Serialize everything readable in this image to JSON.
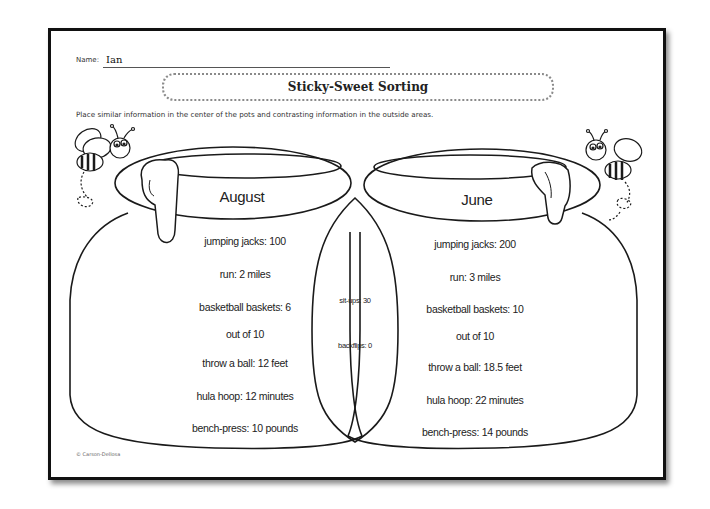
{
  "worksheet": {
    "name_label": "Name:",
    "name_value": "Ian",
    "title": "Sticky-Sweet Sorting",
    "instructions": "Place similar information in the center of the pots and contrasting information in the outside areas.",
    "copyright": "© Carson-Dellosa"
  },
  "left_pot": {
    "heading": "August",
    "items": [
      "jumping jacks: 100",
      "run: 2 miles",
      "basketball baskets: 6",
      "out of 10",
      "throw a ball: 12 feet",
      "hula hoop: 12 minutes",
      "bench-press: 10 pounds"
    ]
  },
  "center_overlap": {
    "items": [
      "sit-ups: 30",
      "backflips: 0"
    ]
  },
  "right_pot": {
    "heading": "June",
    "items": [
      "jumping jacks: 200",
      "run: 3 miles",
      "basketball baskets: 10",
      "out of 10",
      "throw a ball: 18.5 feet",
      "hula hoop: 22 minutes",
      "bench-press: 14 pounds"
    ]
  },
  "decorations": {
    "left_bee": "bee-icon",
    "right_bee": "bee-icon",
    "honey_drip": "honey-drip-icon",
    "pots": "honey-pot-icon"
  }
}
